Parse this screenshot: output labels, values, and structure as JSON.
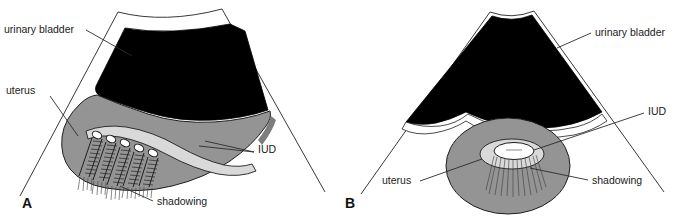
{
  "figure": {
    "type": "medical-illustration",
    "background_color": "#ffffff",
    "colors": {
      "bladder_fill": "#000000",
      "uterus_fill": "#949494",
      "endometrium_fill": "#d9d9d9",
      "iud_fill": "#ffffff",
      "line": "#1e1e1e",
      "label_text": "#1a1a1a"
    }
  },
  "panels": [
    {
      "id": "A",
      "letter": "A",
      "view": "sagittal",
      "labels": [
        {
          "key": "urinary_bladder",
          "text": "urinary bladder",
          "x": 4,
          "y": 33,
          "anchor": "start"
        },
        {
          "key": "uterus",
          "text": "uterus",
          "x": 6,
          "y": 94,
          "anchor": "start"
        },
        {
          "key": "iud",
          "text": "IUD",
          "x": 258,
          "y": 153,
          "anchor": "start"
        },
        {
          "key": "shadowing",
          "text": "shadowing",
          "x": 157,
          "y": 205,
          "anchor": "start"
        }
      ]
    },
    {
      "id": "B",
      "letter": "B",
      "view": "transverse",
      "labels": [
        {
          "key": "urinary_bladder",
          "text": "urinary bladder",
          "x": 595,
          "y": 36,
          "anchor": "start"
        },
        {
          "key": "iud",
          "text": "IUD",
          "x": 648,
          "y": 115,
          "anchor": "start"
        },
        {
          "key": "uterus",
          "text": "uterus",
          "x": 382,
          "y": 184,
          "anchor": "start"
        },
        {
          "key": "shadowing",
          "text": "shadowing",
          "x": 592,
          "y": 184,
          "anchor": "start"
        }
      ]
    }
  ]
}
